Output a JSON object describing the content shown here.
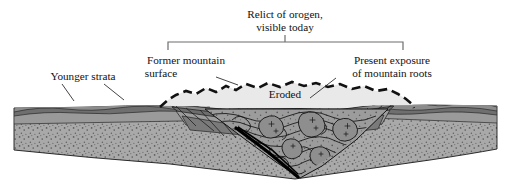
{
  "figure": {
    "type": "geologic-cross-section",
    "background_color": "#ffffff"
  },
  "labels": {
    "bracket_title_line1": "Relict of orogen,",
    "bracket_title_line2": "visible today",
    "former_surface_line1": "Former mountain",
    "former_surface_line2": "surface",
    "present_exposure_line1": "Present exposure",
    "present_exposure_line2": "of mountain roots",
    "eroded": "Eroded",
    "younger_strata": "Younger strata"
  },
  "colors": {
    "basement_fill": "#a9a9a9",
    "stipple": "#5b5b5b",
    "eroded_fill": "#e9e9e9",
    "strata_dark": "#6f6f6f",
    "strata_mid": "#8f8f8f",
    "strata_light": "#c9c9c9",
    "core_fill": "#9a9a9a",
    "pluton_fill": "#8a8a8a",
    "outline": "#1a1a1a",
    "fault_black": "#000000",
    "bracket": "#6a6a6a",
    "leader": "#3a3a3a",
    "text": "#111111"
  },
  "bracket": {
    "x_left": 168,
    "x_right": 403,
    "y_top": 42,
    "tick_x": 285,
    "tick_y_top": 36
  },
  "geometry": {
    "width": 511,
    "height": 185,
    "block_left": 14,
    "block_right": 497,
    "surface_y": 108,
    "base_v_x": 295,
    "base_v_y": 179,
    "core_apex_x": 295,
    "core_apex_y": 176
  }
}
